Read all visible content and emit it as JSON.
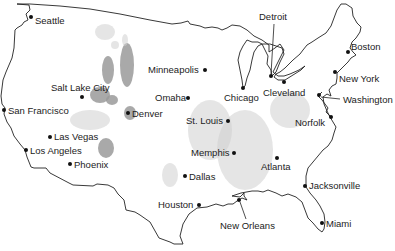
{
  "map": {
    "type": "US major cities outline map",
    "colors": {
      "background": "#ffffff",
      "outline": "#222222",
      "shade": "#9a9a9a",
      "text": "#222222"
    },
    "cities": [
      {
        "name": "Seattle",
        "x": 31,
        "y": 17,
        "lx": 35,
        "ly": 24
      },
      {
        "name": "Salt Lake City",
        "x": 82,
        "y": 97,
        "lx": 51,
        "ly": 91
      },
      {
        "name": "San Francisco",
        "x": 4,
        "y": 110,
        "lx": 8,
        "ly": 114
      },
      {
        "name": "Las Vegas",
        "x": 50,
        "y": 137,
        "lx": 54,
        "ly": 140
      },
      {
        "name": "Los Angeles",
        "x": 26,
        "y": 150,
        "lx": 30,
        "ly": 154
      },
      {
        "name": "Phoenix",
        "x": 70,
        "y": 164,
        "lx": 74,
        "ly": 168
      },
      {
        "name": "Denver",
        "x": 128,
        "y": 113,
        "lx": 132,
        "ly": 117
      },
      {
        "name": "Minneapolis",
        "x": 205,
        "y": 70,
        "lx": 148,
        "ly": 73
      },
      {
        "name": "Omaha",
        "x": 188,
        "y": 98,
        "lx": 155,
        "ly": 101
      },
      {
        "name": "St. Louis",
        "x": 228,
        "y": 121,
        "lx": 186,
        "ly": 124
      },
      {
        "name": "Memphis",
        "x": 234,
        "y": 153,
        "lx": 191,
        "ly": 156
      },
      {
        "name": "Dallas",
        "x": 185,
        "y": 176,
        "lx": 189,
        "ly": 180
      },
      {
        "name": "Houston",
        "x": 199,
        "y": 205,
        "lx": 158,
        "ly": 208
      },
      {
        "name": "Chicago",
        "x": 243,
        "y": 88,
        "lx": 224,
        "ly": 101
      },
      {
        "name": "Detroit",
        "x": 271,
        "y": 76,
        "lx": 259,
        "ly": 20
      },
      {
        "name": "Cleveland",
        "x": 284,
        "y": 82,
        "lx": 263,
        "ly": 96
      },
      {
        "name": "Boston",
        "x": 348,
        "y": 52,
        "lx": 351,
        "ly": 50
      },
      {
        "name": "New York",
        "x": 335,
        "y": 72,
        "lx": 339,
        "ly": 82
      },
      {
        "name": "Washington",
        "x": 319,
        "y": 95,
        "lx": 343,
        "ly": 103
      },
      {
        "name": "Norfolk",
        "x": 331,
        "y": 117,
        "lx": 295,
        "ly": 126
      },
      {
        "name": "Atlanta",
        "x": 277,
        "y": 158,
        "lx": 261,
        "ly": 170
      },
      {
        "name": "Jacksonville",
        "x": 305,
        "y": 186,
        "lx": 309,
        "ly": 189
      },
      {
        "name": "New Orleans",
        "x": 239,
        "y": 200,
        "lx": 220,
        "ly": 229
      },
      {
        "name": "Miami",
        "x": 322,
        "y": 223,
        "lx": 326,
        "ly": 227
      }
    ]
  }
}
